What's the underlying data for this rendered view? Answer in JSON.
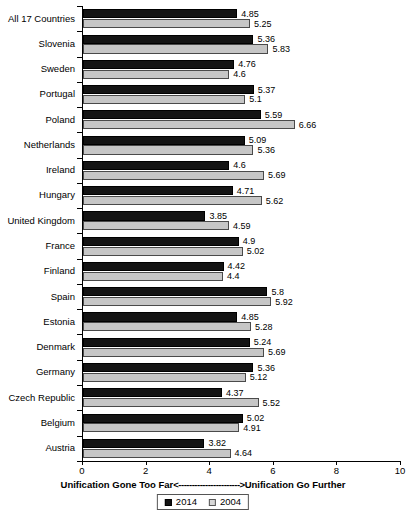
{
  "chart_data": {
    "type": "bar",
    "orientation": "horizontal",
    "title": "",
    "xlabel": "Unification Gone Too Far<----------------------->Unification Go Further",
    "ylabel": "",
    "xlim": [
      0,
      10
    ],
    "xticks": [
      0,
      2,
      4,
      6,
      8,
      10
    ],
    "grid": false,
    "legend_position": "bottom-center",
    "categories": [
      "All 17 Countries",
      "Slovenia",
      "Sweden",
      "Portugal",
      "Poland",
      "Netherlands",
      "Ireland",
      "Hungary",
      "United Kingdom",
      "France",
      "Finland",
      "Spain",
      "Estonia",
      "Denmark",
      "Germany",
      "Czech Republic",
      "Belgium",
      "Austria"
    ],
    "series": [
      {
        "name": "2014",
        "color": "#141414",
        "values": [
          4.85,
          5.36,
          4.76,
          5.37,
          5.59,
          5.09,
          4.6,
          4.71,
          3.85,
          4.9,
          4.42,
          5.8,
          4.85,
          5.24,
          5.36,
          4.37,
          5.02,
          3.82
        ],
        "labels": [
          "4.85",
          "5.36",
          "4.76",
          "5.37",
          "5.59",
          "5.09",
          "4.6",
          "4.71",
          "3.85",
          "4.9",
          "4.42",
          "5.8",
          "4.85",
          "5.24",
          "5.36",
          "4.37",
          "5.02",
          "3.82"
        ]
      },
      {
        "name": "2004",
        "color": "#c6c6c6",
        "values": [
          5.25,
          5.83,
          4.6,
          5.1,
          6.66,
          5.36,
          5.69,
          5.62,
          4.59,
          5.02,
          4.4,
          5.92,
          5.28,
          5.69,
          5.12,
          5.52,
          4.91,
          4.64
        ],
        "labels": [
          "5.25",
          "5.83",
          "4.6",
          "5.1",
          "6.66",
          "5.36",
          "5.69",
          "5.62",
          "4.59",
          "5.02",
          "4.4",
          "5.92",
          "5.28",
          "5.69",
          "5.12",
          "5.52",
          "4.91",
          "4.64"
        ]
      }
    ]
  },
  "axis": {
    "caption_left": "Unification Gone Too Far",
    "caption_arrow": "<----------------------->",
    "caption_right": "Unification Go Further",
    "tick_labels": [
      "0",
      "2",
      "4",
      "6",
      "8",
      "10"
    ]
  },
  "legend": {
    "items": [
      {
        "label": "2014"
      },
      {
        "label": "2004"
      }
    ]
  }
}
